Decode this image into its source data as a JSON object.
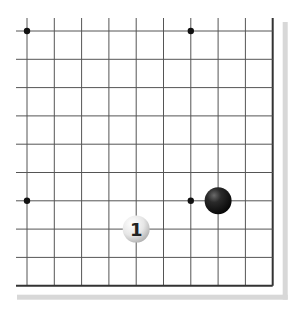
{
  "board": {
    "type": "go-board-partial",
    "visible_columns": 10,
    "visible_rows": 10,
    "edges": [
      "right",
      "bottom"
    ],
    "line_color": "#555555",
    "edge_color": "#333333",
    "shadow_color": "#d8d8d8"
  },
  "star_points": [
    {
      "col": 0,
      "row": 0
    },
    {
      "col": 6,
      "row": 0
    },
    {
      "col": 0,
      "row": 6
    },
    {
      "col": 6,
      "row": 6
    }
  ],
  "stones": [
    {
      "color": "black",
      "col": 7,
      "row": 6,
      "label": ""
    },
    {
      "color": "white",
      "col": 4,
      "row": 7,
      "label": "1"
    }
  ]
}
